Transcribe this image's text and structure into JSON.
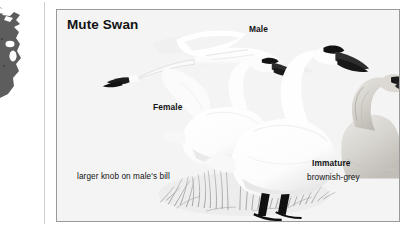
{
  "plate": {
    "title": "Mute Swan",
    "background_color": "#f4f4f4",
    "border_color": "#9a9a9a",
    "text_color": "#121212"
  },
  "map": {
    "icon": "distribution-map-fragment",
    "fill_color": "#5d5d5d"
  },
  "labels": {
    "male": "Male",
    "female": "Female",
    "immature": "Immature",
    "immature_note": "brownish-grey",
    "knob_note": "larger knob on male's bill"
  },
  "figures": [
    {
      "name": "flying-swan",
      "label": "Female",
      "posture": "in flight, wings spread, neck extended left",
      "plumage": "white"
    },
    {
      "name": "standing-swan-rear",
      "label": "Female",
      "posture": "standing, neck curved",
      "plumage": "white"
    },
    {
      "name": "standing-swan-front",
      "label": "Male",
      "posture": "standing, neck curved, black legs",
      "plumage": "white"
    },
    {
      "name": "immature-swan",
      "label": "Immature",
      "posture": "head and neck, facing right",
      "plumage": "brownish-grey"
    }
  ],
  "bill": {
    "color": "#2a2a2a",
    "knob_color": "#151515"
  },
  "grass": {
    "color": "#8e8e8e"
  }
}
